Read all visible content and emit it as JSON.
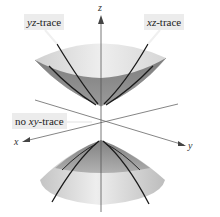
{
  "figure": {
    "labels": {
      "yz_trace": {
        "var": "yz",
        "text": "-trace"
      },
      "xz_trace": {
        "var": "xz",
        "text": "-trace"
      },
      "no_xy_trace": {
        "prefix": "no ",
        "var": "xy",
        "text": "-trace"
      }
    },
    "axes": {
      "x": "x",
      "y": "y",
      "z": "z"
    },
    "colors": {
      "surface_light": "#e6e6e6",
      "surface_mid": "#b8b8b8",
      "surface_dark": "#8c8c8c",
      "trace_line": "#1a1a1a",
      "axis_line": "#555555",
      "label_bg": "#ececec"
    }
  }
}
